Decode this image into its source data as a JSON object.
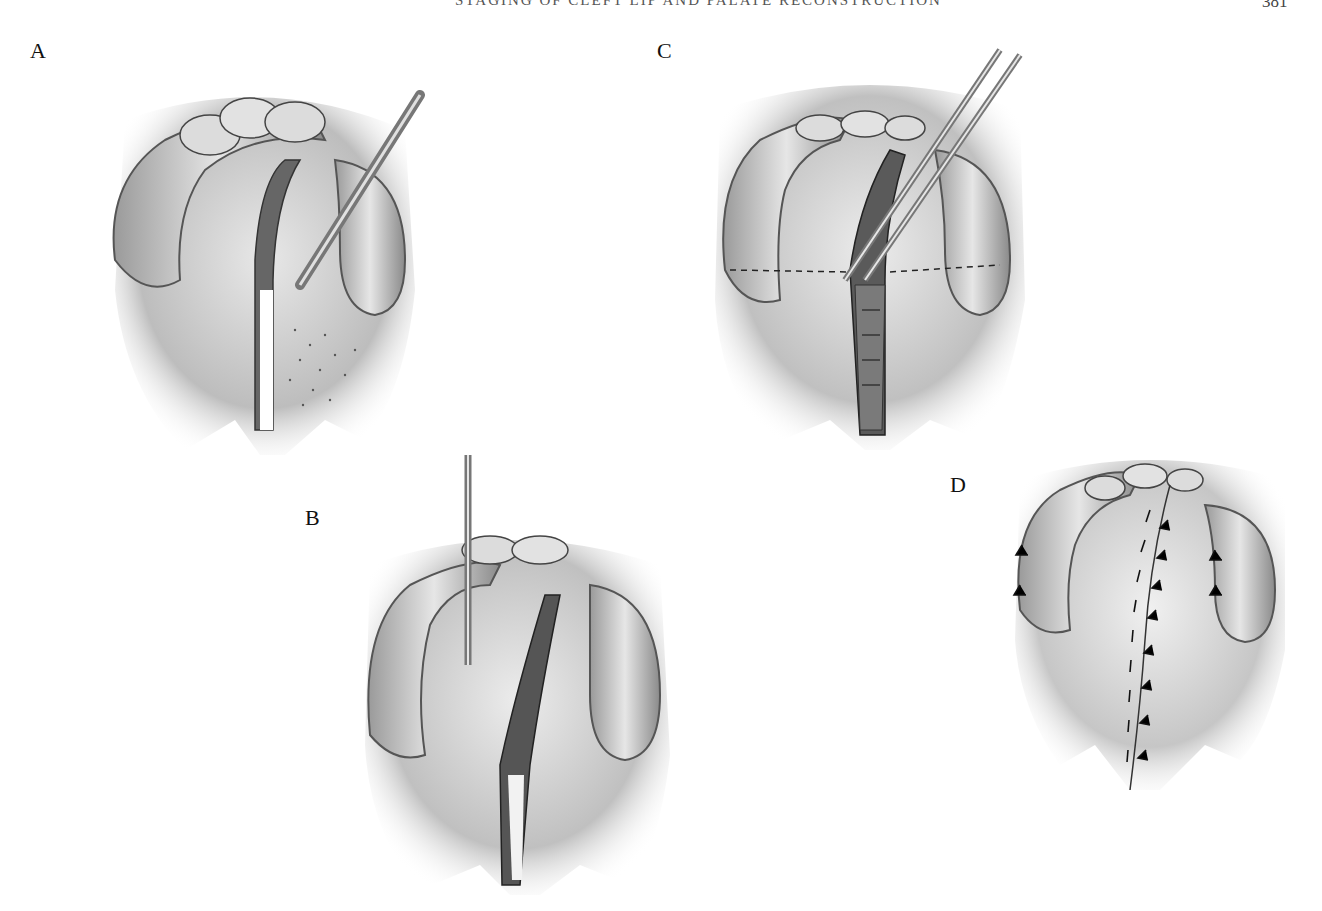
{
  "header": {
    "running_title": "STAGING OF CLEFT LIP AND PALATE RECONSTRUCTION",
    "page_number": "381"
  },
  "figure": {
    "panels": [
      {
        "label": "A",
        "description": "Incision along cleft margin with instrument elevating mucoperiosteal flap"
      },
      {
        "label": "B",
        "description": "Vertical instrument at alveolus with both palatal flaps incised"
      },
      {
        "label": "C",
        "description": "Forceps and needle placing nasal layer sutures; dashed line marking hard/soft palate junction"
      },
      {
        "label": "D",
        "description": "Completed closure with midline sutures and lateral relaxing incision sutures"
      }
    ]
  }
}
